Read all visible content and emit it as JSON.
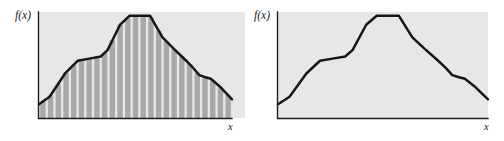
{
  "figure": {
    "background_color": "#ffffff",
    "plot_background_color": "#e7e7e7",
    "curve_color": "#161616",
    "bar_fill_color": "#a9a9a9",
    "bar_gap_color": "#ffffff",
    "axis_color": "#1a1a1a"
  },
  "panels": [
    {
      "id": "left",
      "name": "rectangle-approximation-panel",
      "ylabel": "f(x)",
      "xlabel": "x",
      "shows_rectangles": true,
      "rectangle_count": 25
    },
    {
      "id": "right",
      "name": "function-curve-panel",
      "ylabel": "f(x)",
      "xlabel": "x",
      "shows_rectangles": false,
      "rectangle_count": 0
    }
  ],
  "chart_data": [
    {
      "type": "area",
      "title": "",
      "subtitle": "",
      "xlabel": "x",
      "ylabel": "f(x)",
      "xlim": [
        0,
        1
      ],
      "ylim": [
        0,
        1
      ],
      "grid": false,
      "legend": null,
      "annotations": [],
      "axis_tick_labels": {
        "x": [],
        "y": []
      },
      "series": [
        {
          "name": "f(x)",
          "x": [
            0.0,
            0.055,
            0.135,
            0.2,
            0.26,
            0.32,
            0.355,
            0.42,
            0.47,
            0.575,
            0.64,
            0.7,
            0.76,
            0.8,
            0.83,
            0.862,
            0.89,
            0.935,
            1.0
          ],
          "y": [
            0.13,
            0.2,
            0.42,
            0.54,
            0.56,
            0.58,
            0.64,
            0.88,
            0.965,
            0.965,
            0.76,
            0.65,
            0.545,
            0.47,
            0.405,
            0.385,
            0.37,
            0.3,
            0.175
          ]
        }
      ],
      "fill_under_curve": true,
      "fill_style": "vertical-striped-rectangles",
      "rectangle_count": 25
    },
    {
      "type": "line",
      "title": "",
      "subtitle": "",
      "xlabel": "x",
      "ylabel": "f(x)",
      "xlim": [
        0,
        1
      ],
      "ylim": [
        0,
        1
      ],
      "grid": false,
      "legend": null,
      "annotations": [],
      "axis_tick_labels": {
        "x": [],
        "y": []
      },
      "series": [
        {
          "name": "f(x)",
          "x": [
            0.0,
            0.055,
            0.135,
            0.2,
            0.26,
            0.32,
            0.355,
            0.42,
            0.47,
            0.575,
            0.64,
            0.7,
            0.76,
            0.8,
            0.83,
            0.862,
            0.89,
            0.935,
            1.0
          ],
          "y": [
            0.13,
            0.2,
            0.42,
            0.54,
            0.56,
            0.58,
            0.64,
            0.88,
            0.965,
            0.965,
            0.76,
            0.65,
            0.545,
            0.47,
            0.405,
            0.385,
            0.37,
            0.3,
            0.175
          ]
        }
      ],
      "fill_under_curve": false,
      "fill_style": "none",
      "rectangle_count": 0
    }
  ]
}
